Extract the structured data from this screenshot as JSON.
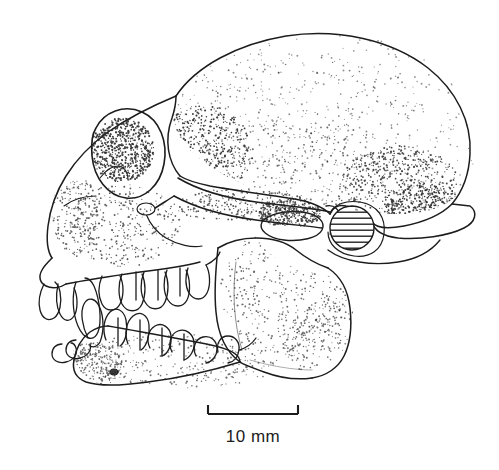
{
  "figure": {
    "kind": "scientific-line-drawing",
    "technique": "ink stipple drawing",
    "orientation": "left lateral, rostrum to the left",
    "background_color": "#ffffff",
    "ink_color": "#1c1c1c",
    "stipple_color": "#2a2a2a"
  },
  "scale_bar": {
    "label": "10 mm",
    "length_px": 90,
    "x_start": 208,
    "x_end": 298,
    "y": 414,
    "tick_height": 9,
    "label_x": 253,
    "label_y": 442
  },
  "anatomy": {
    "parts": [
      {
        "id": "cranial-vault",
        "label": "Cranial vault (neurocranium)"
      },
      {
        "id": "frontal-bone",
        "label": "Frontal bone"
      },
      {
        "id": "orbit",
        "label": "Orbit (eye socket)"
      },
      {
        "id": "nasal-aperture",
        "label": "Nasal aperture region"
      },
      {
        "id": "maxilla",
        "label": "Maxilla"
      },
      {
        "id": "premaxilla",
        "label": "Premaxilla"
      },
      {
        "id": "zygomatic-arch",
        "label": "Zygomatic arch"
      },
      {
        "id": "infraorbital-foramen",
        "label": "Infraorbital foramen"
      },
      {
        "id": "temporal-fossa",
        "label": "Temporal fossa"
      },
      {
        "id": "mandibular-fossa",
        "label": "Mandibular fossa"
      },
      {
        "id": "external-auditory-meatus",
        "label": "External auditory meatus (hatched)"
      },
      {
        "id": "occipital-crest",
        "label": "Occipital / nuchal crest"
      },
      {
        "id": "mandible-ramus",
        "label": "Mandibular ramus"
      },
      {
        "id": "mandible-body",
        "label": "Mandibular body (corpus)"
      },
      {
        "id": "gonial-angle",
        "label": "Gonial angle"
      },
      {
        "id": "mental-foramen",
        "label": "Mental foramen"
      },
      {
        "id": "upper-incisors",
        "label": "Upper incisors"
      },
      {
        "id": "upper-canine",
        "label": "Upper canine"
      },
      {
        "id": "upper-postcanine-row",
        "label": "Upper premolar and molar row"
      },
      {
        "id": "lower-incisors",
        "label": "Lower incisors"
      },
      {
        "id": "lower-canine",
        "label": "Lower canine"
      },
      {
        "id": "lower-postcanine-row",
        "label": "Lower premolar and molar row"
      }
    ]
  },
  "stipple": {
    "seed": 20240607,
    "regions": [
      {
        "id": "vault-upper",
        "cx": 300,
        "cy": 110,
        "rx": 120,
        "ry": 58,
        "count": 210,
        "size": 0.8,
        "opacity": 0.62
      },
      {
        "id": "vault-lower",
        "cx": 310,
        "cy": 165,
        "rx": 115,
        "ry": 42,
        "count": 260,
        "size": 0.85,
        "opacity": 0.7
      },
      {
        "id": "vault-rear-dense",
        "cx": 400,
        "cy": 180,
        "rx": 58,
        "ry": 34,
        "count": 430,
        "size": 0.9,
        "opacity": 0.85
      },
      {
        "id": "occipital-crest-dense",
        "cx": 425,
        "cy": 205,
        "rx": 42,
        "ry": 20,
        "count": 330,
        "size": 0.9,
        "opacity": 0.9
      },
      {
        "id": "temporal-line",
        "cx": 205,
        "cy": 150,
        "rx": 48,
        "ry": 45,
        "count": 520,
        "size": 0.9,
        "opacity": 0.9
      },
      {
        "id": "frontal",
        "cx": 120,
        "cy": 135,
        "rx": 48,
        "ry": 45,
        "count": 300,
        "size": 0.85,
        "opacity": 0.72
      },
      {
        "id": "orbit-interior",
        "cx": 122,
        "cy": 150,
        "rx": 32,
        "ry": 32,
        "count": 620,
        "size": 0.95,
        "opacity": 0.92
      },
      {
        "id": "maxilla-face",
        "cx": 125,
        "cy": 225,
        "rx": 55,
        "ry": 42,
        "count": 330,
        "size": 0.85,
        "opacity": 0.75
      },
      {
        "id": "premax-snout",
        "cx": 72,
        "cy": 215,
        "rx": 28,
        "ry": 42,
        "count": 230,
        "size": 0.85,
        "opacity": 0.72
      },
      {
        "id": "zygomatic",
        "cx": 240,
        "cy": 205,
        "rx": 70,
        "ry": 16,
        "count": 260,
        "size": 0.85,
        "opacity": 0.78
      },
      {
        "id": "mandibular-fossa-rim",
        "cx": 290,
        "cy": 213,
        "rx": 32,
        "ry": 14,
        "count": 300,
        "size": 0.9,
        "opacity": 0.88
      },
      {
        "id": "ramus",
        "cx": 285,
        "cy": 290,
        "rx": 65,
        "ry": 62,
        "count": 420,
        "size": 0.85,
        "opacity": 0.68
      },
      {
        "id": "gonial",
        "cx": 330,
        "cy": 340,
        "rx": 48,
        "ry": 38,
        "count": 300,
        "size": 0.85,
        "opacity": 0.68
      },
      {
        "id": "mandible-corpus",
        "cx": 180,
        "cy": 360,
        "rx": 105,
        "ry": 28,
        "count": 330,
        "size": 0.85,
        "opacity": 0.66
      },
      {
        "id": "mandible-chin",
        "cx": 92,
        "cy": 365,
        "rx": 32,
        "ry": 22,
        "count": 220,
        "size": 0.85,
        "opacity": 0.72
      }
    ]
  }
}
